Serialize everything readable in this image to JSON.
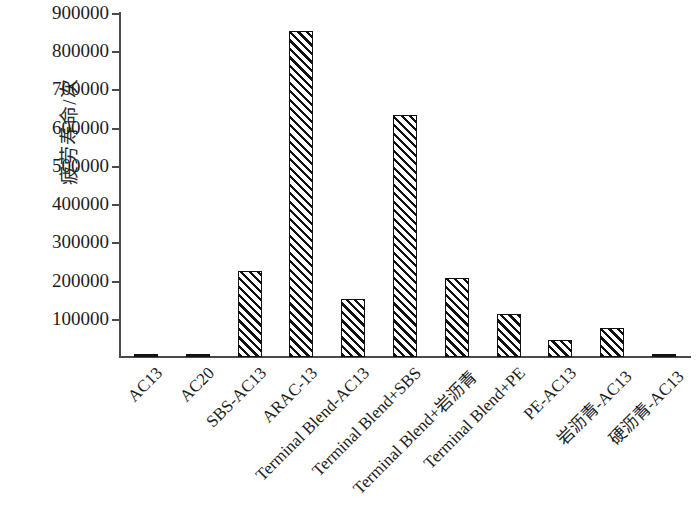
{
  "chart_data": {
    "type": "bar",
    "title": "",
    "xlabel": "",
    "ylabel": "疲劳寿命/次",
    "ylim": [
      0,
      900000
    ],
    "ytick_step": 100000,
    "grid": false,
    "legend": "none",
    "bar_fill": "diagonal-hatch",
    "bar_edge_color": "#111111",
    "axis_color": "#4a4a4a",
    "yticks": [
      "100000",
      "200000",
      "300000",
      "400000",
      "500000",
      "600000",
      "700000",
      "800000",
      "900000"
    ],
    "categories": [
      "AC13",
      "AC20",
      "SBS-AC13",
      "ARAC-13",
      "Terminal Blend-AC13",
      "Terminal Blend+SBS",
      "Terminal Blend+岩沥青",
      "Terminal Blend+PE",
      "PE-AC13",
      "岩沥青-AC13",
      "硬沥青-AC13"
    ],
    "values": [
      4000,
      3000,
      225000,
      852000,
      152000,
      632000,
      207000,
      113000,
      45000,
      75000,
      3000
    ]
  }
}
